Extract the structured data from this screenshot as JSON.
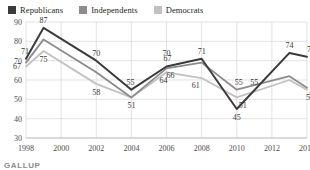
{
  "legend": {
    "position": "top-left",
    "items": [
      {
        "label": "Republicans",
        "color": "#3c3a3b"
      },
      {
        "label": "Independents",
        "color": "#8d8b8c"
      },
      {
        "label": "Democrats",
        "color": "#c2c0c1"
      }
    ]
  },
  "source": {
    "text": "GALLUP"
  },
  "chart_data": {
    "type": "line",
    "title": "",
    "subtitle": "",
    "xlabel": "",
    "ylabel": "",
    "grid": true,
    "ylim": [
      30,
      90
    ],
    "yticks": [
      30,
      40,
      50,
      60,
      70,
      80,
      90
    ],
    "xlim": [
      1998,
      2014
    ],
    "xticks": [
      1998,
      2000,
      2002,
      2004,
      2006,
      2008,
      2010,
      2012,
      2014
    ],
    "x": [
      1998,
      1999,
      2002,
      2004,
      2006,
      2008,
      2010,
      2013,
      2014
    ],
    "series": [
      {
        "name": "Republicans",
        "color": "#3c3a3b",
        "values": [
          71,
          87,
          70,
          55,
          67,
          71,
          45,
          74,
          72
        ],
        "labels": [
          "71",
          "87",
          "70",
          "55",
          "67",
          "71",
          "45",
          "74",
          "72"
        ]
      },
      {
        "name": "Independents",
        "color": "#8d8b8c",
        "values": [
          69,
          81,
          64,
          51,
          66,
          69,
          55,
          62,
          56
        ],
        "labels": [
          "",
          "",
          "",
          "51",
          "66",
          "",
          "55",
          "",
          "56"
        ]
      },
      {
        "name": "Democrats",
        "color": "#c2c0c1",
        "values": [
          67,
          75,
          58,
          51,
          64,
          61,
          51,
          60,
          55
        ],
        "labels": [
          "67",
          "75",
          "58",
          "",
          "64",
          "61",
          "51",
          "",
          "55"
        ]
      }
    ],
    "annotations": [
      {
        "text": "70",
        "x": 2006,
        "y": 70
      },
      {
        "text": "55",
        "x": 2011,
        "y": 55
      }
    ]
  }
}
